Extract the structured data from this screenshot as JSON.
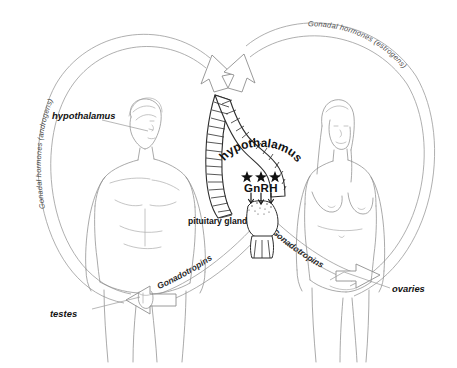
{
  "diagram": {
    "background_color": "#ffffff",
    "line_color": "#8d8d8d",
    "ink_color": "#111111",
    "center": {
      "hypothalamus_label": "hypothalamus",
      "gnrh_label": "GnRH",
      "pituitary_label": "pituitary gland",
      "star_count": 3,
      "gnrh_arrow_count": 3
    },
    "feedback_arcs": [
      {
        "id": "androgens",
        "label": "Gonadal hormones (androgens)",
        "side": "left",
        "direction": "gonads-to-hypothalamus"
      },
      {
        "id": "estrogens",
        "label": "Gonadal hormones (estrogens)",
        "side": "right",
        "direction": "gonads-to-hypothalamus"
      },
      {
        "id": "gonadotropins-left",
        "label": "Gonadotropins",
        "side": "left",
        "direction": "pituitary-to-testes"
      },
      {
        "id": "gonadotropins-right",
        "label": "Gonadotropins",
        "side": "right",
        "direction": "pituitary-to-ovaries"
      }
    ],
    "pointer_labels": [
      {
        "id": "hypothalamus-male",
        "text": "hypothalamus",
        "target": "male-head"
      },
      {
        "id": "testes",
        "text": "testes",
        "target": "male-groin"
      },
      {
        "id": "ovaries",
        "text": "ovaries",
        "target": "female-pelvis"
      }
    ],
    "figures": [
      {
        "id": "male-figure",
        "name": "male figure",
        "side": "left"
      },
      {
        "id": "female-figure",
        "name": "female figure",
        "side": "right"
      }
    ]
  }
}
